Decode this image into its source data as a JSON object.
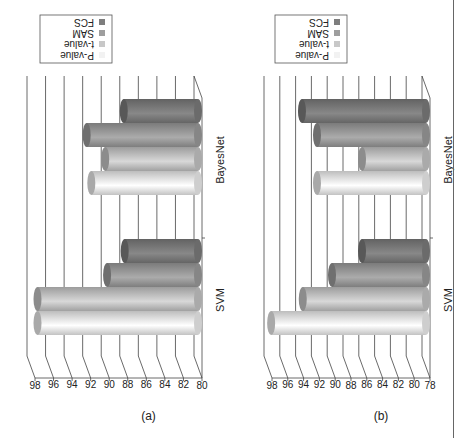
{
  "chart_data": [
    {
      "type": "bar",
      "style": "3d-cylinder-column",
      "panel_label": "(a)",
      "categories": [
        "SVM",
        "BayesNet"
      ],
      "series": [
        {
          "name": "P-value",
          "values": [
            97.3,
            91.5
          ],
          "color": "#f2f2f2"
        },
        {
          "name": "t-value",
          "values": [
            97.3,
            90.0
          ],
          "color": "#c8c8c8"
        },
        {
          "name": "SAM",
          "values": [
            89.8,
            92.0
          ],
          "color": "#9e9e9e"
        },
        {
          "name": "FCS",
          "values": [
            87.9,
            88.0
          ],
          "color": "#7e7e7e"
        }
      ],
      "title": "",
      "xlabel": "",
      "ylabel": "",
      "ylim": [
        80,
        98
      ],
      "yticks": [
        "80",
        "82",
        "84",
        "86",
        "88",
        "90",
        "92",
        "94",
        "96",
        "98"
      ],
      "grid": true,
      "legend_position": "right-top",
      "rotation": "figure rotated 90 degrees counter-clockwise"
    },
    {
      "type": "bar",
      "style": "3d-cylinder-column",
      "panel_label": "(b)",
      "categories": [
        "SVM",
        "BayesNet"
      ],
      "series": [
        {
          "name": "P-value",
          "values": [
            97.6,
            91.8
          ],
          "color": "#f2f2f2"
        },
        {
          "name": "t-value",
          "values": [
            93.6,
            86.1
          ],
          "color": "#c8c8c8"
        },
        {
          "name": "SAM",
          "values": [
            89.9,
            91.8
          ],
          "color": "#9e9e9e"
        },
        {
          "name": "FCS",
          "values": [
            86.1,
            93.7
          ],
          "color": "#7e7e7e"
        }
      ],
      "title": "",
      "xlabel": "",
      "ylabel": "",
      "ylim": [
        78,
        98
      ],
      "yticks": [
        "78",
        "80",
        "82",
        "84",
        "86",
        "88",
        "90",
        "92",
        "94",
        "96",
        "98"
      ],
      "grid": true,
      "legend_position": "right-top",
      "rotation": "figure rotated 90 degrees counter-clockwise"
    }
  ]
}
